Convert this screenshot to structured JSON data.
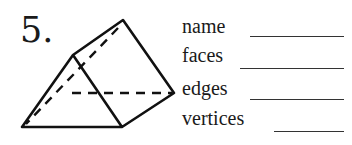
{
  "problem": {
    "number": "5.",
    "figure": "triangular-prism",
    "fields": [
      {
        "label": "name",
        "value": ""
      },
      {
        "label": "faces",
        "value": ""
      },
      {
        "label": "edges",
        "value": ""
      },
      {
        "label": "vertices",
        "value": ""
      }
    ]
  }
}
